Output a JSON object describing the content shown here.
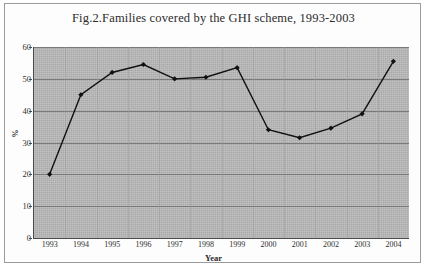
{
  "figure": {
    "title": "Fig.2.Families covered by the GHI scheme, 1993-2003",
    "frame_color": "#9b9b9b",
    "plot_background": "#a9a9a9",
    "line_color": "#111111"
  },
  "axes": {
    "y_title": "%",
    "x_title": "Year",
    "y_ticks": [
      "0",
      "10",
      "20",
      "30",
      "40",
      "50",
      "60"
    ],
    "x_ticks": [
      "1993",
      "1994",
      "1995",
      "1996",
      "1997",
      "1998",
      "1999",
      "2000",
      "2001",
      "2002",
      "2003",
      "2004"
    ]
  },
  "chart_data": {
    "type": "line",
    "title": "Fig.2.Families covered by the GHI scheme, 1993-2003",
    "xlabel": "Year",
    "ylabel": "%",
    "categories": [
      "1993",
      "1994",
      "1995",
      "1996",
      "1997",
      "1998",
      "1999",
      "2000",
      "2001",
      "2002",
      "2003",
      "2004"
    ],
    "values": [
      20,
      45,
      52,
      54.5,
      50,
      50.5,
      53.5,
      34,
      31.5,
      34.5,
      39,
      55.5
    ],
    "ylim": [
      0,
      60
    ],
    "ytick_step": 10,
    "grid": true,
    "legend": "none",
    "marker": "diamond",
    "series": [
      {
        "name": "Families covered by the GHI scheme",
        "values": [
          20,
          45,
          52,
          54.5,
          50,
          50.5,
          53.5,
          34,
          31.5,
          34.5,
          39,
          55.5
        ]
      }
    ]
  }
}
